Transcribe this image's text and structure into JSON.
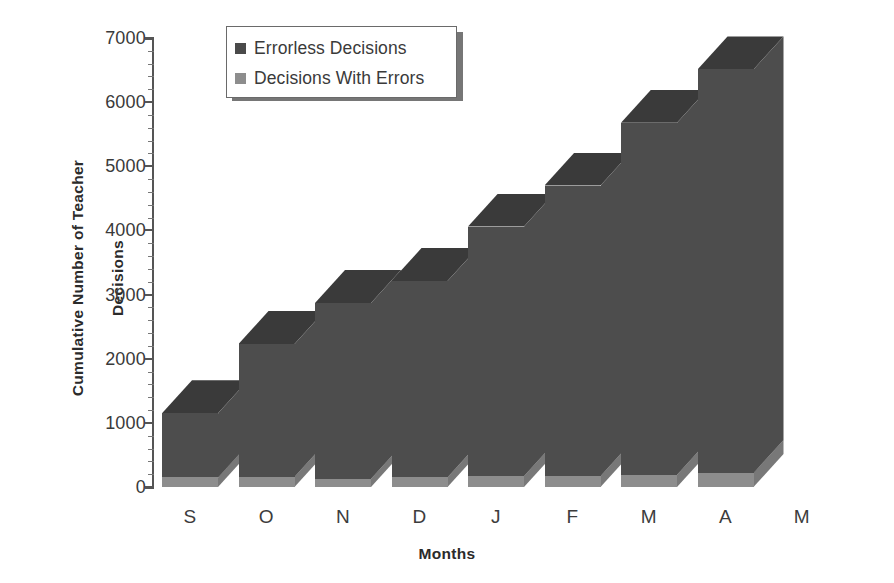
{
  "chart_data": {
    "type": "bar",
    "subtype": "stacked-3d-column",
    "title": "",
    "xlabel": "Months",
    "ylabel": "Cumulative Number of Teacher\nDecisions",
    "categories": [
      "S",
      "O",
      "N",
      "D",
      "J",
      "F",
      "M",
      "A",
      "M"
    ],
    "series": [
      {
        "name": "Errorless Decisions",
        "color": "#4a4a4a",
        "values": [
          1000,
          2070,
          2740,
          3060,
          3890,
          4530,
          5490,
          6290,
          null
        ]
      },
      {
        "name": "Decisions With Errors",
        "color": "#8d8d8d",
        "values": [
          150,
          160,
          130,
          150,
          170,
          170,
          190,
          220,
          null
        ]
      }
    ],
    "totals": [
      1150,
      2230,
      2870,
      3210,
      4060,
      4700,
      5680,
      6510,
      null
    ],
    "ylim": [
      0,
      7000
    ],
    "ytick_step": 1000,
    "yticks": [
      0,
      1000,
      2000,
      3000,
      4000,
      5000,
      6000,
      7000
    ],
    "ytick_labels": [
      "0",
      "1000",
      "2000",
      "3000",
      "4000",
      "5000",
      "6000",
      "7000"
    ],
    "minor_ticks_per_interval": 4,
    "grid": false,
    "legend_position": "top-left-inside",
    "note": "Last category M has no plotted bar"
  },
  "axis": {
    "y_title_line1": "Cumulative Number of Teacher",
    "y_title_line2": "Decisions",
    "x_title": "Months"
  },
  "legend": {
    "items": [
      {
        "label": "Errorless Decisions",
        "color": "#4a4a4a"
      },
      {
        "label": "Decisions With Errors",
        "color": "#8d8d8d"
      }
    ]
  },
  "colors": {
    "bar_front_dark": "#4d4d4d",
    "bar_top_dark": "#3a3a3a",
    "bar_front_light": "#8d8d8d",
    "bar_top_light": "#a6a6a6",
    "bar_side_light": "#787878",
    "axis": "#555555",
    "text": "#333333",
    "background": "#ffffff"
  }
}
